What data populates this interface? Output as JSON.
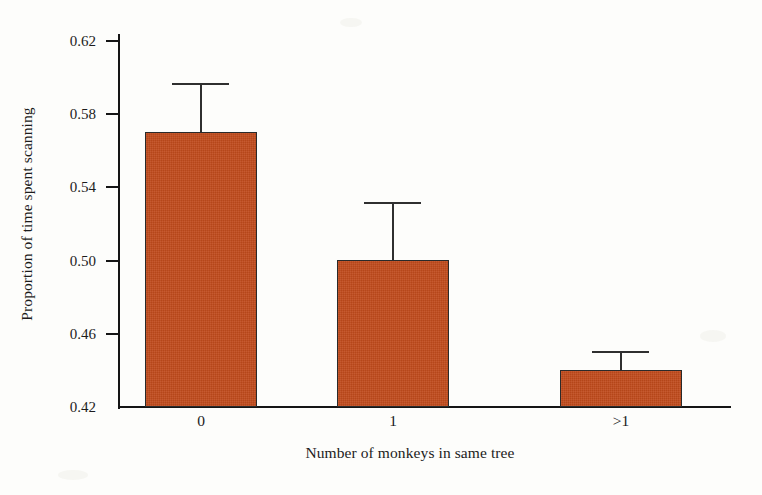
{
  "chart_data": {
    "type": "bar",
    "title": "",
    "xlabel": "Number of monkeys in same tree",
    "ylabel": "Proportion of time spent scanning",
    "categories": [
      "0",
      "1",
      ">1"
    ],
    "values": [
      0.57,
      0.5,
      0.44
    ],
    "error_upper": [
      0.596,
      0.531,
      0.45
    ],
    "errors": [
      0.026,
      0.031,
      0.01
    ],
    "ylim": [
      0.42,
      0.62
    ],
    "yticks": [
      0.42,
      0.46,
      0.5,
      0.54,
      0.58,
      0.62
    ],
    "ytick_labels": [
      "0.42",
      "0.46",
      "0.50",
      "0.54",
      "0.58",
      "0.62"
    ],
    "grid": false,
    "legend": "none",
    "bar_color": "#c04a1b",
    "axis_color": "#151515",
    "background": "#fdfdfb"
  },
  "axes": {
    "y_label": "Proportion of time spent scanning",
    "x_label": "Number of monkeys in same tree",
    "y_ticks": [
      {
        "value": 0.62,
        "label": "0.62"
      },
      {
        "value": 0.58,
        "label": "0.58"
      },
      {
        "value": 0.54,
        "label": "0.54"
      },
      {
        "value": 0.5,
        "label": "0.50"
      },
      {
        "value": 0.46,
        "label": "0.46"
      },
      {
        "value": 0.42,
        "label": "0.42"
      }
    ],
    "x_ticks": [
      {
        "label": "0"
      },
      {
        "label": "1"
      },
      {
        "label": ">1"
      }
    ]
  },
  "bars": [
    {
      "category": "0",
      "value": 0.57,
      "error_top": 0.596
    },
    {
      "category": "1",
      "value": 0.5,
      "error_top": 0.531
    },
    {
      "category": ">1",
      "value": 0.44,
      "error_top": 0.45
    }
  ]
}
